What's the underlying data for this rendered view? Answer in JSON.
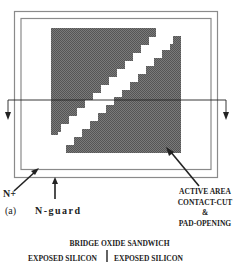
{
  "figure": {
    "panel_label": "(a)",
    "labels": {
      "n_plus": "N+",
      "n_guard": "N-guard",
      "active_area": [
        "ACTIVE AREA",
        "CONTACT-CUT",
        "&",
        "PAD-OPENING"
      ],
      "bridge_oxide": "BRIDGE OXIDE SANDWICH",
      "exposed_silicon_left": "EXPOSED SILICON",
      "exposed_silicon_right": "EXPOSED SILICON"
    },
    "colors": {
      "outline": "#8a8a8a",
      "active_fill": "#6e6e6e",
      "line": "#222222"
    }
  }
}
